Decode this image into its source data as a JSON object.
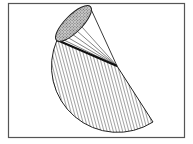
{
  "diagram": {
    "frame": {
      "x": 8,
      "y": 3,
      "width": 177,
      "height": 135,
      "stroke": "#555555"
    },
    "colors": {
      "line": "#222222",
      "hatch": "#444444",
      "ellipse_fill": "#9a9a9a",
      "background": "#ffffff"
    },
    "apex": {
      "x": 117,
      "y": 66
    },
    "base_ellipse": {
      "cx": 73.5,
      "cy": 23.5,
      "rx": 23,
      "ry": 9,
      "rotate": -45
    },
    "sector": {
      "radius": 66,
      "start": {
        "x": 57,
        "y": 40
      },
      "end": {
        "x": 153,
        "y": 122
      }
    },
    "labels": []
  }
}
